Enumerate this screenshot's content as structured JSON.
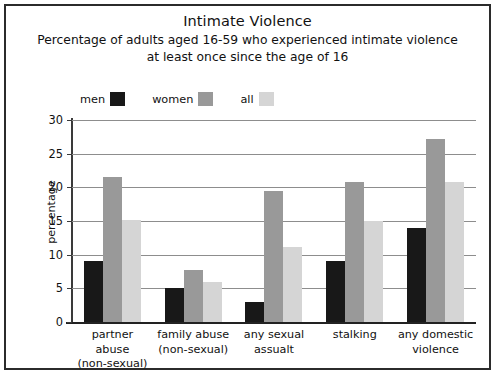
{
  "chart_data": {
    "type": "bar",
    "title": "Intimate Violence",
    "subtitle": "Percentage of adults aged 16-59 who experienced intimate violence at least once since the age of 16",
    "xlabel": "",
    "ylabel": "percentage",
    "ylim": [
      0,
      30
    ],
    "ytick_labels": [
      "0",
      "5",
      "10",
      "15",
      "20",
      "25",
      "30"
    ],
    "ytick_values": [
      0,
      5,
      10,
      15,
      20,
      25,
      30
    ],
    "grid": true,
    "legend_position": "top-left",
    "categories": [
      "partner abuse\n(non-sexual)",
      "family abuse\n(non-sexual)",
      "any sexual\nassualt",
      "stalking",
      "any domestic\nviolence"
    ],
    "category_lines": [
      [
        "partner abuse",
        "(non-sexual)"
      ],
      [
        "family abuse",
        "(non-sexual)"
      ],
      [
        "any sexual",
        "assualt"
      ],
      [
        "stalking",
        ""
      ],
      [
        "any domestic",
        "violence"
      ]
    ],
    "series": [
      {
        "name": "men",
        "color": "#181818",
        "values": [
          9.0,
          5.0,
          3.0,
          9.0,
          14.0
        ]
      },
      {
        "name": "women",
        "color": "#999999",
        "values": [
          21.5,
          7.7,
          19.4,
          20.8,
          27.2
        ]
      },
      {
        "name": "all",
        "color": "#d5d5d5",
        "values": [
          15.2,
          6.0,
          11.2,
          15.0,
          20.8
        ]
      }
    ]
  },
  "colors": {
    "border": "#2b2b2b",
    "axis": "#222222",
    "gridline": "#8d8d8d",
    "text": "#111111",
    "background": "#ffffff"
  }
}
